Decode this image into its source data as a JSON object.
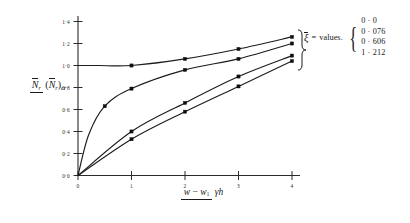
{
  "chart_data": {
    "type": "line",
    "title": "",
    "xlabel": "(w - w1) / (gamma h)",
    "ylabel": "N_r / (N_r)_cr",
    "xlim": [
      0,
      4.3
    ],
    "ylim": [
      0,
      1.45
    ],
    "xticks": [
      "0",
      "1",
      "2",
      "3",
      "4"
    ],
    "xtick_values": [
      0,
      1,
      2,
      3,
      4
    ],
    "yticks": [
      "0·0",
      "0·2",
      "0·4",
      "0·6",
      "0·8",
      "1·0",
      "1·2",
      "1·4"
    ],
    "ytick_values": [
      0.0,
      0.2,
      0.4,
      0.6,
      0.8,
      1.0,
      1.2,
      1.4
    ],
    "grid": false,
    "legend_position": "right",
    "legend_key": "ξ",
    "legend_eq": "=",
    "legend_word": "values.",
    "series": [
      {
        "name": "0·0",
        "label": "0 · 0",
        "x": [
          0,
          0.15,
          0.4,
          1,
          2,
          3,
          4
        ],
        "y": [
          1.0,
          1.0,
          1.0,
          1.0,
          1.06,
          1.15,
          1.26
        ],
        "markers_x": [
          1,
          2,
          3,
          4
        ],
        "markers_y": [
          1.0,
          1.06,
          1.15,
          1.26
        ]
      },
      {
        "name": "0·076",
        "label": "0 · 076",
        "x": [
          0,
          0.2,
          0.5,
          1,
          2,
          3,
          4
        ],
        "y": [
          0.0,
          0.37,
          0.63,
          0.79,
          0.96,
          1.06,
          1.2
        ],
        "markers_x": [
          0.5,
          1,
          2,
          3,
          4
        ],
        "markers_y": [
          0.63,
          0.79,
          0.96,
          1.06,
          1.2
        ]
      },
      {
        "name": "0·606",
        "label": "0 · 606",
        "x": [
          0,
          1,
          2,
          3,
          4
        ],
        "y": [
          0.0,
          0.4,
          0.66,
          0.9,
          1.09
        ],
        "markers_x": [
          1,
          2,
          3,
          4
        ],
        "markers_y": [
          0.4,
          0.66,
          0.9,
          1.09
        ]
      },
      {
        "name": "1·212",
        "label": "1 · 212",
        "x": [
          0,
          1,
          2,
          3,
          4
        ],
        "y": [
          0.0,
          0.33,
          0.58,
          0.81,
          1.04
        ],
        "markers_x": [
          1,
          2,
          3,
          4
        ],
        "markers_y": [
          0.33,
          0.58,
          0.81,
          1.04
        ]
      }
    ]
  },
  "axes": {
    "ylabel_numerator": "N",
    "ylabel_numerator_sub": "r",
    "ylabel_denominator_open": "(",
    "ylabel_denominator_n": "N",
    "ylabel_denominator_sub": "r",
    "ylabel_denominator_close": ")",
    "ylabel_denominator_cr": "cr",
    "xlabel_numerator_w": "w",
    "xlabel_numerator_minus": "−",
    "xlabel_numerator_w1": "w",
    "xlabel_numerator_w1sub": "1",
    "xlabel_denominator_gamma": "γ",
    "xlabel_denominator_h": "h"
  },
  "legend": {
    "symbol": "ξ",
    "equals": "=",
    "word": "values.",
    "brace_left": "{",
    "items": [
      "0 · 0",
      "0 · 076",
      "0 · 606",
      "1 · 212"
    ]
  }
}
